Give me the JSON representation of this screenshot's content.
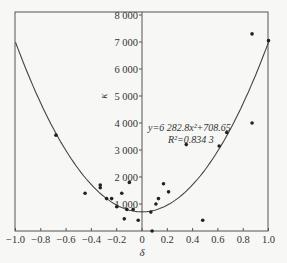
{
  "chart_data": {
    "type": "scatter",
    "title": "",
    "xlabel": "δ",
    "ylabel": "κ",
    "xlim": [
      -1.0,
      1.0
    ],
    "ylim": [
      0,
      8000
    ],
    "x_ticks": [
      "-1.0",
      "-0.8",
      "-0.6",
      "-0.4",
      "-0.2",
      "0",
      "0.2",
      "0.4",
      "0.6",
      "0.8",
      "1.0"
    ],
    "y_ticks": [
      "1 000",
      "2 000",
      "3 000",
      "4 000",
      "5 000",
      "6 000",
      "7 000",
      "8 000"
    ],
    "grid": false,
    "legend": "none",
    "fit": {
      "type": "quadratic",
      "a": 6282.8,
      "c": 708.65,
      "equation": "y=6 282.8x²+708.65",
      "r2_label": "R²=0.834 3"
    },
    "series": [
      {
        "name": "data",
        "points": [
          [
            -0.68,
            3550
          ],
          [
            -0.45,
            1400
          ],
          [
            -0.33,
            1700
          ],
          [
            -0.33,
            1600
          ],
          [
            -0.28,
            1200
          ],
          [
            -0.24,
            1200
          ],
          [
            -0.2,
            900
          ],
          [
            -0.16,
            1400
          ],
          [
            -0.14,
            450
          ],
          [
            -0.12,
            800
          ],
          [
            -0.1,
            1800
          ],
          [
            -0.07,
            800
          ],
          [
            -0.03,
            400
          ],
          [
            0.07,
            700
          ],
          [
            0.08,
            0
          ],
          [
            0.11,
            1000
          ],
          [
            0.13,
            1200
          ],
          [
            0.17,
            1750
          ],
          [
            0.21,
            1450
          ],
          [
            0.35,
            3200
          ],
          [
            0.48,
            400
          ],
          [
            0.61,
            3150
          ],
          [
            0.67,
            3650
          ],
          [
            0.87,
            4000
          ],
          [
            0.87,
            7300
          ],
          [
            1.0,
            7050
          ]
        ]
      }
    ]
  }
}
